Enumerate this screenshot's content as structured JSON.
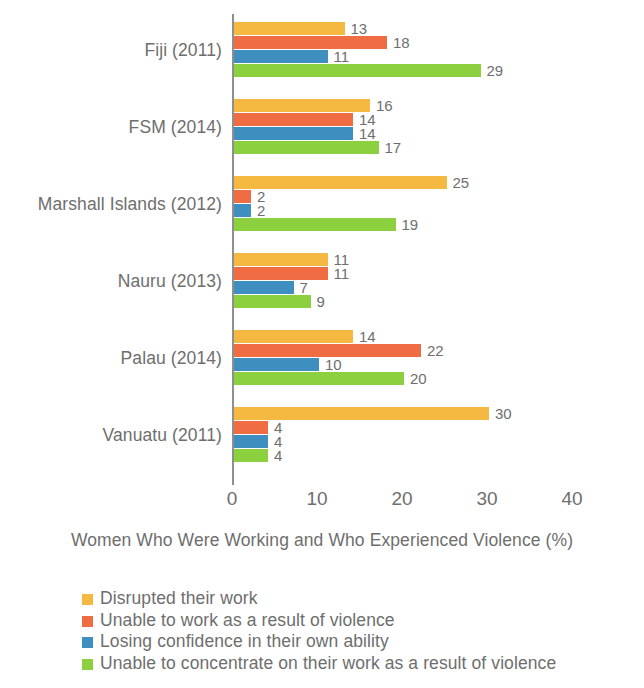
{
  "chart_data": {
    "type": "bar",
    "orientation": "horizontal",
    "title": "",
    "xlabel": "Women Who Were Working and Who Experienced Violence (%)",
    "ylabel": "",
    "categories": [
      "Fiji (2011)",
      "FSM (2014)",
      "Marshall Islands (2012)",
      "Nauru (2013)",
      "Palau (2014)",
      "Vanuatu (2011)"
    ],
    "series": [
      {
        "name": "Disrupted their work",
        "color": "#F5B942",
        "values": [
          13,
          16,
          25,
          11,
          14,
          30
        ]
      },
      {
        "name": "Unable to work as a result of violence",
        "color": "#F06C43",
        "values": [
          18,
          14,
          2,
          11,
          22,
          4
        ]
      },
      {
        "name": "Losing confidence in their own ability",
        "color": "#3E8FC0",
        "values": [
          11,
          14,
          2,
          7,
          10,
          4
        ]
      },
      {
        "name": "Unable to concentrate on their work as a result of violence",
        "color": "#8CCF3F",
        "values": [
          29,
          17,
          19,
          9,
          20,
          4
        ]
      }
    ],
    "xlim": [
      0,
      40
    ],
    "x_ticks": [
      0,
      10,
      20,
      30,
      40
    ],
    "x_tick_labels": [
      "0",
      "10",
      "20",
      "30",
      "40"
    ],
    "grid": false,
    "legend_position": "bottom-left",
    "data_labels": true,
    "axis_color": "#8f8f8f",
    "text_color": "#6e6e6e",
    "background": "#ffffff"
  }
}
